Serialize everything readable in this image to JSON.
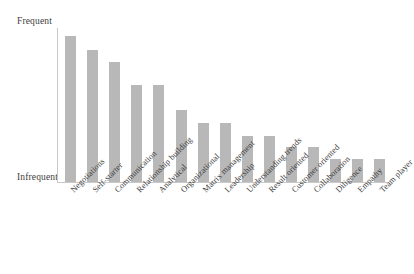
{
  "chart_data": {
    "type": "bar",
    "title": "",
    "xlabel": "",
    "ylabel": "",
    "grid": false,
    "legend": null,
    "orientation": "vertical",
    "bar_color": "#b8b8b8",
    "axis_color": "#c9c9c9",
    "y_axis_anchors": {
      "top": "Frequent",
      "bottom": "Infrequent"
    },
    "ylim": [
      0,
      100
    ],
    "y_tick_labels": [],
    "categories": [
      "Negotiations",
      "Self-starter",
      "Communication",
      "Relationship building",
      "Analytical",
      "Organizational",
      "Matrix management",
      "Leadership",
      "Understanding trends",
      "Result oriented",
      "Customer oriented",
      "Collaboration",
      "Diligence",
      "Empathy",
      "Team player"
    ],
    "values": [
      95,
      86,
      78,
      63,
      63,
      47,
      38,
      38,
      30,
      30,
      23,
      23,
      15,
      15,
      15
    ],
    "x_tick_rotation": -45
  }
}
